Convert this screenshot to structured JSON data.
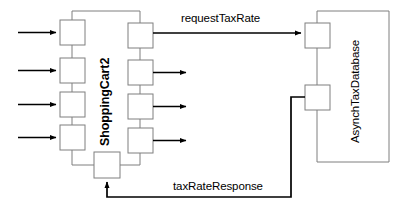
{
  "diagram": {
    "type": "uml-sequence-collaboration",
    "background_color": "#ffffff",
    "stroke_color": "#7f7f7f",
    "arrow_color": "#000000",
    "text_color": "#000000",
    "participants": [
      {
        "id": "shoppingcart2",
        "label": "ShoppingCart2",
        "orientation": "vertical-ccw",
        "emphasis": "bold"
      },
      {
        "id": "asynchtaxdatabase",
        "label": "AsynchTaxDatabase",
        "orientation": "vertical-ccw",
        "emphasis": "normal"
      }
    ],
    "messages": [
      {
        "id": "request",
        "label": "requestTaxRate",
        "direction": "left-to-right",
        "from": "shoppingcart2",
        "to": "asynchtaxdatabase"
      },
      {
        "id": "response",
        "label": "taxRateResponse",
        "direction": "right-to-left",
        "from": "asynchtaxdatabase",
        "to": "shoppingcart2"
      }
    ],
    "inbound_arrows": 4,
    "outbound_arrows": 3,
    "activation_boxes": {
      "shoppingcart2_left_column": 4,
      "shoppingcart2_right_column": 4,
      "shoppingcart2_bottom": 1,
      "asynchtaxdatabase": 2
    }
  }
}
